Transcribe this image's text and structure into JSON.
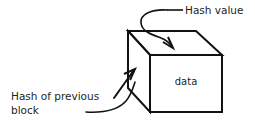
{
  "diagram": {
    "background_color": "#ffffff",
    "stroke_color": "#111111",
    "text_color": "#221f1f",
    "cube": {
      "front_face_label": "data",
      "face_fill": "#ffffff"
    },
    "annotations": [
      {
        "id": "hash-value",
        "label": "Hash value",
        "points_to": "cube-top-face"
      },
      {
        "id": "hash-of-previous-block",
        "label_line_1": "Hash of previous",
        "label_line_2": "block",
        "points_to": "cube-left-face"
      }
    ]
  }
}
